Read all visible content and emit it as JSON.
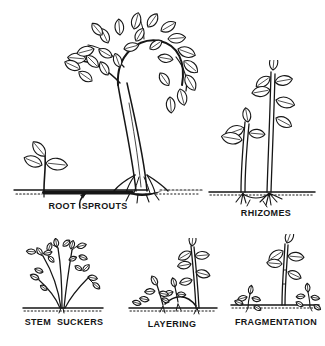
{
  "page": {
    "background_color": "#ffffff",
    "ink_color": "#161616"
  },
  "diagram": {
    "figures": [
      {
        "name": "root-sprouts",
        "label": "ROOT SPROUTS"
      },
      {
        "name": "rhizomes",
        "label": "RHIZOMES"
      },
      {
        "name": "stem-suckers",
        "label": "STEM SUCKERS"
      },
      {
        "name": "layering",
        "label": "LAYERING"
      },
      {
        "name": "fragmentation",
        "label": "FRAGMENTATION"
      }
    ]
  }
}
